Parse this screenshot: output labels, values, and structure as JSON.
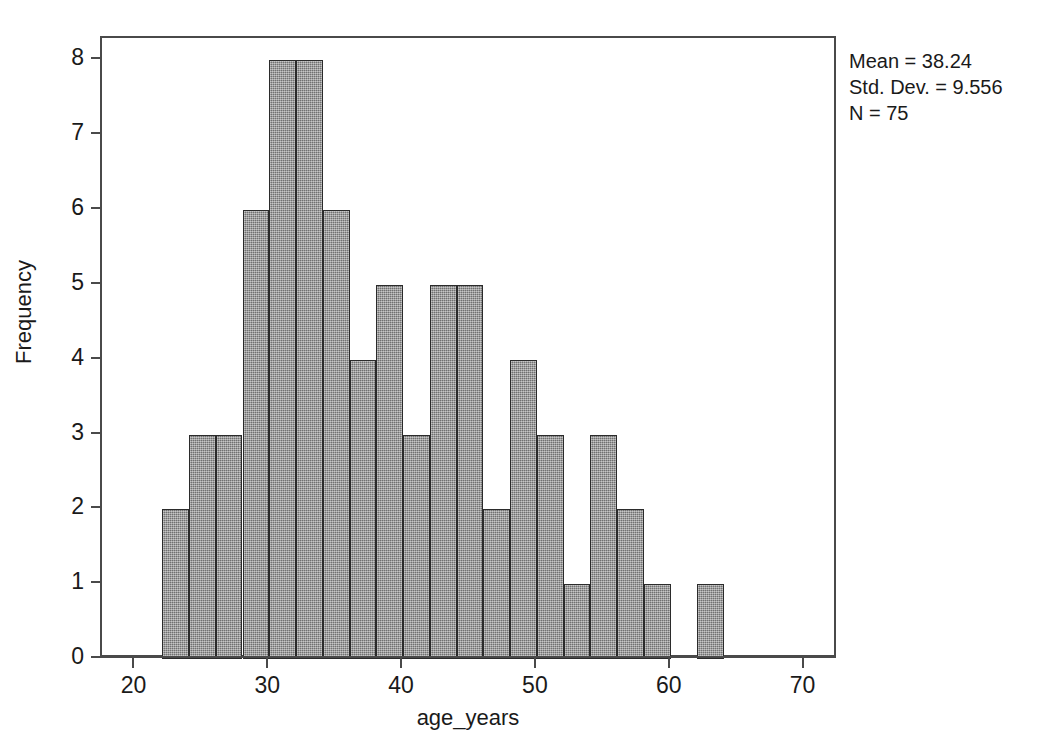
{
  "chart_data": {
    "type": "bar",
    "title": "",
    "xlabel": "age_years",
    "ylabel": "Frequency",
    "xlim": [
      17.5,
      72.5
    ],
    "ylim": [
      0,
      8.3
    ],
    "grid": false,
    "legend": "none",
    "bin_width": 2,
    "x_ticks": [
      "20",
      "30",
      "40",
      "50",
      "60",
      "70"
    ],
    "x_tick_values": [
      20,
      30,
      40,
      50,
      60,
      70
    ],
    "y_ticks": [
      "0",
      "1",
      "2",
      "3",
      "4",
      "5",
      "6",
      "7",
      "8"
    ],
    "y_tick_values": [
      0,
      1,
      2,
      3,
      4,
      5,
      6,
      7,
      8
    ],
    "bin_edges": [
      22,
      24,
      26,
      28,
      30,
      32,
      34,
      36,
      38,
      40,
      42,
      44,
      46,
      48,
      50,
      52,
      54,
      56,
      58,
      60,
      62,
      64
    ],
    "bins": [
      {
        "start": 22,
        "end": 24,
        "count": 2
      },
      {
        "start": 24,
        "end": 26,
        "count": 3
      },
      {
        "start": 26,
        "end": 28,
        "count": 3
      },
      {
        "start": 28,
        "end": 30,
        "count": 6
      },
      {
        "start": 30,
        "end": 32,
        "count": 8
      },
      {
        "start": 32,
        "end": 34,
        "count": 8
      },
      {
        "start": 34,
        "end": 36,
        "count": 6
      },
      {
        "start": 36,
        "end": 38,
        "count": 4
      },
      {
        "start": 38,
        "end": 40,
        "count": 5
      },
      {
        "start": 40,
        "end": 42,
        "count": 3
      },
      {
        "start": 42,
        "end": 44,
        "count": 5
      },
      {
        "start": 44,
        "end": 46,
        "count": 5
      },
      {
        "start": 46,
        "end": 48,
        "count": 2
      },
      {
        "start": 48,
        "end": 50,
        "count": 4
      },
      {
        "start": 50,
        "end": 52,
        "count": 3
      },
      {
        "start": 52,
        "end": 54,
        "count": 1
      },
      {
        "start": 54,
        "end": 56,
        "count": 3
      },
      {
        "start": 56,
        "end": 58,
        "count": 2
      },
      {
        "start": 58,
        "end": 60,
        "count": 1
      },
      {
        "start": 60,
        "end": 62,
        "count": 0
      },
      {
        "start": 62,
        "end": 64,
        "count": 1
      }
    ],
    "categories": [
      "22-24",
      "24-26",
      "26-28",
      "28-30",
      "30-32",
      "32-34",
      "34-36",
      "36-38",
      "38-40",
      "40-42",
      "42-44",
      "44-46",
      "46-48",
      "48-50",
      "50-52",
      "52-54",
      "54-56",
      "56-58",
      "58-60",
      "60-62",
      "62-64"
    ],
    "values": [
      2,
      3,
      3,
      6,
      8,
      8,
      6,
      4,
      5,
      3,
      5,
      5,
      2,
      4,
      3,
      1,
      3,
      2,
      1,
      0,
      1
    ],
    "bar_fill_color": "#8f8f8f",
    "bar_edge_color": "#2b2b2b",
    "axis_color": "#4a4a4a"
  },
  "annotations": {
    "mean": "Mean = 38.24",
    "std_dev": "Std. Dev. = 9.556",
    "n": "N = 75"
  }
}
